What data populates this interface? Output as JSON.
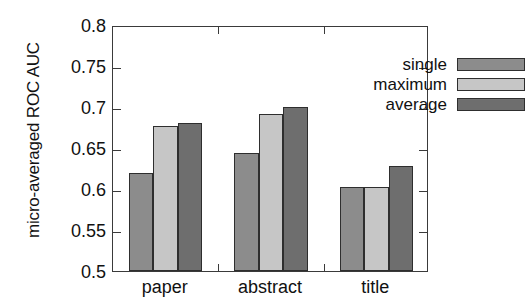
{
  "chart_data": {
    "type": "bar",
    "title": "",
    "xlabel": "",
    "ylabel": "micro-averaged ROC AUC",
    "categories": [
      "paper",
      "abstract",
      "title"
    ],
    "series": [
      {
        "name": "single",
        "color": "#8c8c8c",
        "values": [
          0.619,
          0.644,
          0.603
        ]
      },
      {
        "name": "maximum",
        "color": "#c6c6c6",
        "values": [
          0.677,
          0.692,
          0.602
        ]
      },
      {
        "name": "average",
        "color": "#6e6e6e",
        "values": [
          0.681,
          0.7,
          0.628
        ]
      }
    ],
    "ylim": [
      0.5,
      0.8
    ],
    "ytick_labels": [
      "0.8",
      "0.75",
      "0.7",
      "0.65",
      "0.6",
      "0.55",
      "0.5"
    ],
    "ytick_values": [
      0.8,
      0.75,
      0.7,
      0.65,
      0.6,
      0.55,
      0.5
    ],
    "grid": false,
    "legend_position": "top-right",
    "axis_color": "#3a3a3a",
    "bar_edge_color": "#2e2e2e"
  }
}
